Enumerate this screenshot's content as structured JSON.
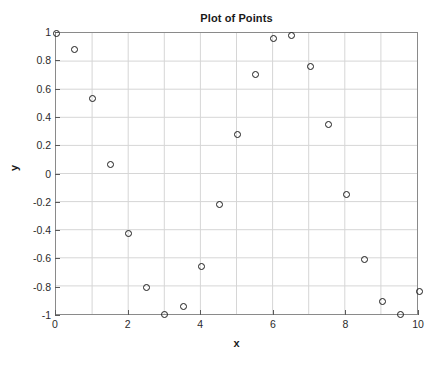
{
  "figure": {
    "background_color": "#ffffff",
    "axes_border_color": "#8a8a8a",
    "grid_color": "#d6d6d6",
    "marker_color": "#1c1c1c",
    "text_color": "#1a1a1a"
  },
  "chart_data": {
    "type": "scatter",
    "title": "Plot of Points",
    "xlabel": "x",
    "ylabel": "y",
    "xlim": [
      0,
      10
    ],
    "ylim": [
      -1,
      1
    ],
    "grid": true,
    "legend": null,
    "marker": "open-circle",
    "xticks": [
      0,
      2,
      4,
      6,
      8,
      10
    ],
    "xticklabels": [
      "0",
      "2",
      "4",
      "6",
      "8",
      "10"
    ],
    "yticks": [
      1,
      0.8,
      0.6,
      0.4,
      0.2,
      0,
      -0.2,
      -0.4,
      -0.6,
      -0.8,
      -1
    ],
    "yticklabels": [
      "1",
      "0.8",
      "0.6",
      "0.4",
      "0.2",
      "0",
      "-0.2",
      "-0.4",
      "-0.6",
      "-0.8",
      "-1"
    ],
    "x_gridlines": [
      0,
      1,
      2,
      3,
      4,
      5,
      6,
      7,
      8,
      9,
      10
    ],
    "y_gridlines": [
      1,
      0.8,
      0.6,
      0.4,
      0.2,
      0,
      -0.2,
      -0.4,
      -0.6,
      -0.8,
      -1
    ],
    "x": [
      0,
      0.5,
      1,
      1.5,
      2,
      2.5,
      3,
      3.5,
      4,
      4.5,
      5,
      5.5,
      6,
      6.5,
      7,
      7.5,
      8,
      8.5,
      9,
      9.5,
      10
    ],
    "y": [
      1.0,
      0.88,
      0.54,
      0.07,
      -0.42,
      -0.8,
      -0.99,
      -0.93,
      -0.65,
      -0.21,
      0.28,
      0.71,
      0.96,
      0.98,
      0.76,
      0.35,
      -0.14,
      -0.6,
      -0.9,
      -0.99,
      -0.83
    ],
    "points": [
      {
        "x": 0,
        "y": 1.0
      },
      {
        "x": 0.5,
        "y": 0.88
      },
      {
        "x": 1,
        "y": 0.54
      },
      {
        "x": 1.5,
        "y": 0.07
      },
      {
        "x": 2,
        "y": -0.42
      },
      {
        "x": 2.5,
        "y": -0.8
      },
      {
        "x": 3,
        "y": -0.99
      },
      {
        "x": 3.5,
        "y": -0.93
      },
      {
        "x": 4,
        "y": -0.65
      },
      {
        "x": 4.5,
        "y": -0.21
      },
      {
        "x": 5,
        "y": 0.28
      },
      {
        "x": 5.5,
        "y": 0.71
      },
      {
        "x": 6,
        "y": 0.96
      },
      {
        "x": 6.5,
        "y": 0.98
      },
      {
        "x": 7,
        "y": 0.76
      },
      {
        "x": 7.5,
        "y": 0.35
      },
      {
        "x": 8,
        "y": -0.14
      },
      {
        "x": 8.5,
        "y": -0.6
      },
      {
        "x": 9,
        "y": -0.9
      },
      {
        "x": 9.5,
        "y": -0.99
      },
      {
        "x": 10,
        "y": -0.83
      }
    ]
  }
}
